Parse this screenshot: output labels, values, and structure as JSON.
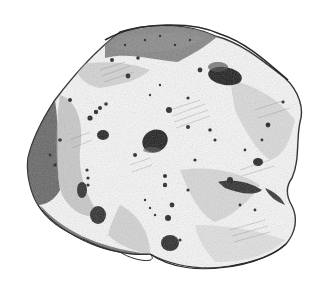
{
  "image": {
    "subject": "pencil drawing of a pitted rock / asteroid",
    "alt": "Graphite sketch of an irregular cratered rock with dark pits",
    "colors": {
      "background": "#ffffff",
      "outline": "#2a2a2a",
      "shade_dark": "#3a3a3a",
      "shade_mid": "#8a8a8a",
      "shade_light": "#c8c8c8",
      "highlight": "#f7f7f7"
    }
  }
}
